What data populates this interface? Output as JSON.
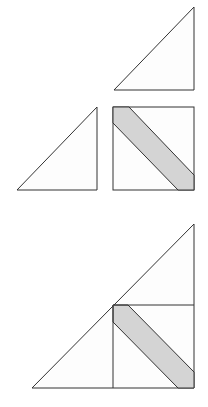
{
  "colors": {
    "background": "#ffffff",
    "stroke": "#333333",
    "piece_fill": "#fdfdfd",
    "band_fill": "#d4d4d4"
  },
  "pieces": {
    "top_triangle": "114,90 194,90 194,7",
    "left_triangle": "17,190 97,190 97,107",
    "square": {
      "x": 113,
      "y": 107,
      "w": 81,
      "h": 83
    },
    "square_band": "113,107 129,107 194,175 194,190 178,190 113,123"
  },
  "assembled": {
    "big_triangle": "32,388 194,388 194,224",
    "horizontal_seam": {
      "x1": 113,
      "y1": 305,
      "x2": 194,
      "y2": 305
    },
    "vertical_seam": {
      "x1": 113,
      "y1": 305,
      "x2": 113,
      "y2": 388
    },
    "band": "113,305 128,305 194,372 194,388 178,388 113,322"
  }
}
